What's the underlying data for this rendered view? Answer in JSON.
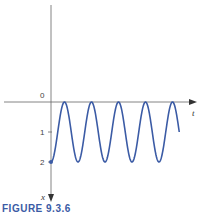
{
  "chart_data": {
    "type": "line",
    "title": "",
    "caption": "FIGURE 9.3.6",
    "xlabel": "t",
    "ylabel": "x",
    "y_axis_direction": "down",
    "yticks": [
      "0",
      "1",
      "2"
    ],
    "ylim": [
      0,
      3.3
    ],
    "xlim": [
      0,
      5.5
    ],
    "series": [
      {
        "name": "x(t)",
        "function": "x = 1 + cos(2*pi*t)",
        "t_range": [
          0,
          4.75
        ],
        "initial_point": {
          "t": 0,
          "x": 2
        },
        "peaks_at_x": 0,
        "troughs_at_x": 2,
        "color": "#3b5ba5"
      }
    ],
    "grid": false
  }
}
